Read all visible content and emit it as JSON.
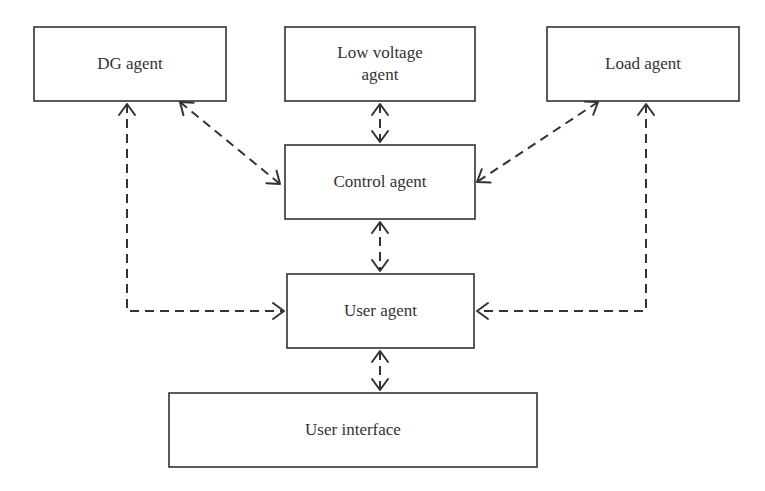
{
  "diagram": {
    "nodes": [
      {
        "id": "dg",
        "label": [
          "DG agent"
        ]
      },
      {
        "id": "lv",
        "label": [
          "Low voltage",
          "agent"
        ]
      },
      {
        "id": "load",
        "label": [
          "Load agent"
        ]
      },
      {
        "id": "control",
        "label": [
          "Control agent"
        ]
      },
      {
        "id": "user",
        "label": [
          "User agent"
        ]
      },
      {
        "id": "ui",
        "label": [
          "User interface"
        ]
      }
    ],
    "edges": [
      {
        "from": "dg",
        "to": "control",
        "style": "dashed",
        "direction": "both"
      },
      {
        "from": "lv",
        "to": "control",
        "style": "dashed",
        "direction": "both"
      },
      {
        "from": "load",
        "to": "control",
        "style": "dashed",
        "direction": "both"
      },
      {
        "from": "control",
        "to": "user",
        "style": "dashed",
        "direction": "both"
      },
      {
        "from": "dg",
        "to": "user",
        "style": "dashed",
        "direction": "both"
      },
      {
        "from": "load",
        "to": "user",
        "style": "dashed",
        "direction": "both"
      },
      {
        "from": "user",
        "to": "ui",
        "style": "dashed",
        "direction": "both"
      }
    ]
  }
}
